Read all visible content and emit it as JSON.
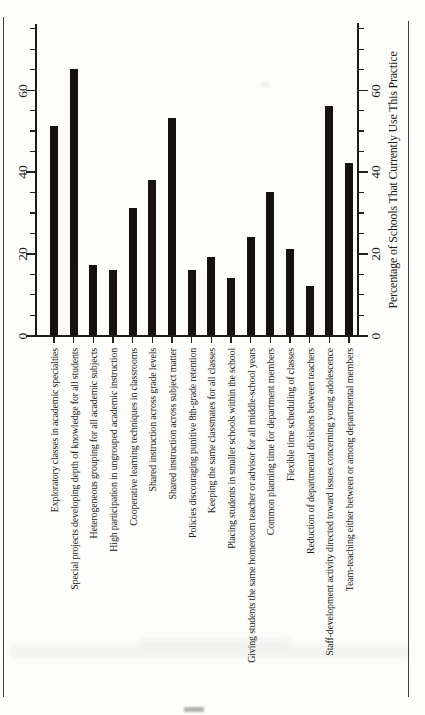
{
  "chart_data": {
    "type": "bar",
    "orientation": "rotated-90-counterclockwise",
    "title": "",
    "value_axis_label": "Percentage of Schools That Currently Use This Practice",
    "value_ticks": [
      0,
      20,
      40,
      60
    ],
    "minor_tick_step": 5,
    "value_axis_max": 76,
    "grid": false,
    "bar_color": "#17120e",
    "categories": [
      "Exploratory classes in academic specialties",
      "Special projects developing depth of knowledge for all students",
      "Heterogeneous grouping for all academic subjects",
      "High participation in ungrouped academic instruction",
      "Cooperative learning techniques in classrooms",
      "Shared instruction across grade levels",
      "Shared instruction across subject matter",
      "Policies discouraging punitive 8th-grade retention",
      "Keeping the same classmates for all classes",
      "Placing students in smaller schools within the school",
      "Giving students the same homeroom teacher or advisor for all middle-school years",
      "Common planning time for department members",
      "Flexible time scheduling of classes",
      "Reduction of departmental divisions between teachers",
      "Staff-development activity directed toward issues concerning young adolescence",
      "Team-teaching either between or among departmental members"
    ],
    "values": [
      51,
      65,
      17,
      16,
      31,
      38,
      53,
      16,
      19,
      14,
      24,
      35,
      21,
      12,
      56,
      42
    ]
  }
}
